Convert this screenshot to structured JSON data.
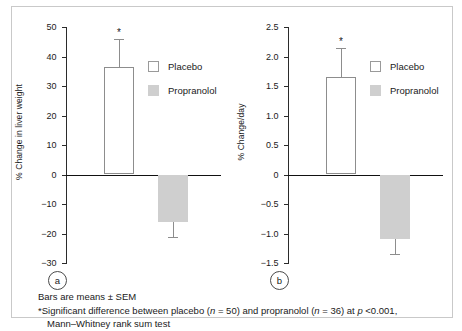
{
  "figure": {
    "caption_line1": "Bars are means ± SEM",
    "caption_line2_prefix": "*Significant difference between placebo (",
    "caption_n1_italic": "n",
    "caption_n1_value": " = 50) and propranolol (",
    "caption_n2_italic": "n",
    "caption_n2_value": " = 36) at ",
    "caption_p_italic": "p",
    "caption_p_value": " <0.001,",
    "caption_line3": "Mann–Whitney rank sum test",
    "significance_marker": "*"
  },
  "legend": {
    "placebo_label": "Placebo",
    "propranolol_label": "Propranolol",
    "placebo_color": "#ffffff",
    "propranolol_color": "#cfcfcf"
  },
  "panels": {
    "a": {
      "letter": "a"
    },
    "b": {
      "letter": "b"
    }
  },
  "chart_data": [
    {
      "type": "bar",
      "panel": "a",
      "title": "",
      "xlabel": "",
      "ylabel": "% Change in liver weight",
      "categories": [
        "Placebo",
        "Propranolol"
      ],
      "values": [
        36.5,
        -16.0
      ],
      "errors": [
        9.5,
        5.2
      ],
      "error_type": "SEM",
      "ylim": [
        -30,
        50
      ],
      "yticks": [
        50,
        40,
        30,
        20,
        10,
        0,
        -10,
        -20,
        -30
      ],
      "ytick_labels": [
        "50",
        "40",
        "30",
        "20",
        "10",
        "0",
        "-10",
        "-20",
        "-30"
      ],
      "grid": false,
      "legend_position": "upper-right",
      "annotations": [
        {
          "series": "Placebo",
          "text": "*",
          "value": 46.0
        }
      ]
    },
    {
      "type": "bar",
      "panel": "b",
      "title": "",
      "xlabel": "",
      "ylabel": "% Change/day",
      "categories": [
        "Placebo",
        "Propranolol"
      ],
      "values": [
        1.65,
        -1.1
      ],
      "errors": [
        0.5,
        0.25
      ],
      "error_type": "SEM",
      "ylim": [
        -1.5,
        2.5
      ],
      "yticks": [
        2.5,
        2.0,
        1.5,
        1.0,
        0.5,
        0,
        -0.5,
        -1.0,
        -1.5
      ],
      "ytick_labels": [
        "2.5",
        "2.0",
        "1.5",
        "1.0",
        "0.5",
        "0",
        "-0.5",
        "-1.0",
        "-1.5"
      ],
      "grid": false,
      "legend_position": "upper-right",
      "annotations": [
        {
          "series": "Placebo",
          "text": "*",
          "value": 2.15
        }
      ]
    }
  ]
}
